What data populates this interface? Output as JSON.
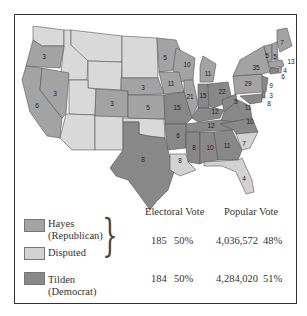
{
  "legend": {
    "hayes": {
      "label_line1": "Hayes",
      "label_line2": "(Republican)",
      "color": "#a3a3a3"
    },
    "disputed": {
      "label": "Disputed",
      "color": "#d2d2d2"
    },
    "tilden": {
      "label_line1": "Tilden",
      "label_line2": "(Democrat)",
      "color": "#888888"
    }
  },
  "table": {
    "electoral_header": "Electoral Vote",
    "popular_header": "Popular Vote",
    "hayes_group": {
      "electoral": "185",
      "electoral_pct": "50%",
      "popular": "4,036,572",
      "popular_pct": "48%"
    },
    "tilden": {
      "electoral": "184",
      "electoral_pct": "50%",
      "popular": "4,284,020",
      "popular_pct": "51%"
    }
  },
  "colors": {
    "republican": "#a3a3a3",
    "democrat": "#888888",
    "disputed": "#d2d2d2",
    "territory": "#d9d9d9",
    "border": "#555555"
  },
  "states": {
    "OR": "3",
    "CA": "6",
    "NV": "3",
    "CO": "3",
    "NE": "3",
    "KS": "5",
    "TX": "8",
    "MN": "5",
    "WI": "10",
    "IA": "11",
    "IL": "21",
    "MO": "15",
    "MI": "11",
    "IN": "15",
    "OH": "22",
    "KY": "12",
    "WV": "5",
    "VA": "11",
    "TN": "12",
    "NC": "10",
    "AR": "6",
    "MS": "8",
    "AL": "10",
    "GA": "11",
    "SC": "7",
    "LA": "8",
    "FL": "4",
    "PA": "29",
    "NY": "35",
    "VT": "5",
    "NH": "5",
    "ME": "7",
    "MA": "13",
    "RI": "4",
    "CT": "6",
    "NJ": "9",
    "DE": "3",
    "MD": "8"
  }
}
